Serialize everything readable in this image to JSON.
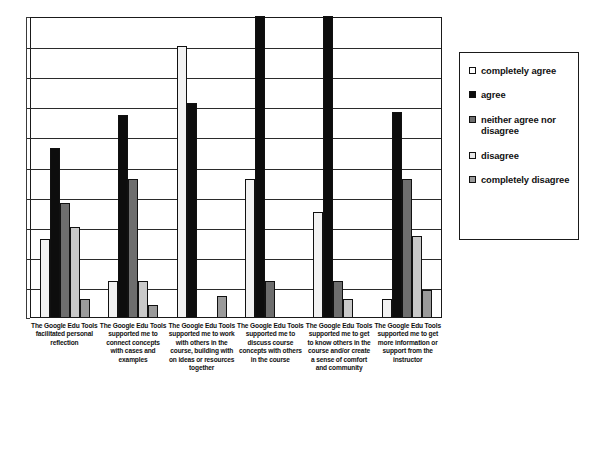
{
  "chart_data": {
    "type": "bar",
    "title": "",
    "xlabel": "",
    "ylabel": "",
    "ylim": [
      0,
      10
    ],
    "grid": true,
    "gridline_count": 10,
    "legend_position": "right",
    "categories": [
      "The Google Edu Tools facilitated personal reflection",
      "The Google Edu Tools supported me to connect concepts with cases and examples",
      "The Google Edu Tools supported me to work with others in the course, building with on ideas or resources together",
      "The Google Edu Tools supported me to discuss course concepts with others in the course",
      "The Google Edu Tools supported me to get to know others in the course and/or create a sense of comfort and community",
      "The Google Edu Tools supported me to get more information or support from the instructor"
    ],
    "series": [
      {
        "name": "completely agree",
        "color": "#f2f2f2",
        "values": [
          2.6,
          1.2,
          9.0,
          4.6,
          3.5,
          0.6
        ]
      },
      {
        "name": "agree",
        "color": "#0d0d0d",
        "values": [
          5.6,
          6.7,
          7.1,
          10.0,
          10.0,
          6.8
        ]
      },
      {
        "name": "neither agree nor disagree",
        "color": "#6e6e6e",
        "values": [
          3.8,
          4.6,
          0.0,
          1.2,
          1.2,
          4.6
        ]
      },
      {
        "name": "disagree",
        "color": "#c9c9c9",
        "values": [
          3.0,
          1.2,
          0.0,
          0.0,
          0.6,
          2.7
        ]
      },
      {
        "name": "completely disagree",
        "color": "#9a9a9a",
        "values": [
          0.6,
          0.4,
          0.7,
          0.0,
          0.0,
          0.9
        ]
      }
    ]
  },
  "legend": {
    "items": [
      {
        "label": "completely agree",
        "swatch": "#ffffff"
      },
      {
        "label": "agree",
        "swatch": "#0d0d0d"
      },
      {
        "label": "neither agree nor disagree",
        "swatch": "#6e6e6e"
      },
      {
        "label": "disagree",
        "swatch": "#e8e8e8"
      },
      {
        "label": "completely disagree",
        "swatch": "#9a9a9a"
      }
    ]
  }
}
